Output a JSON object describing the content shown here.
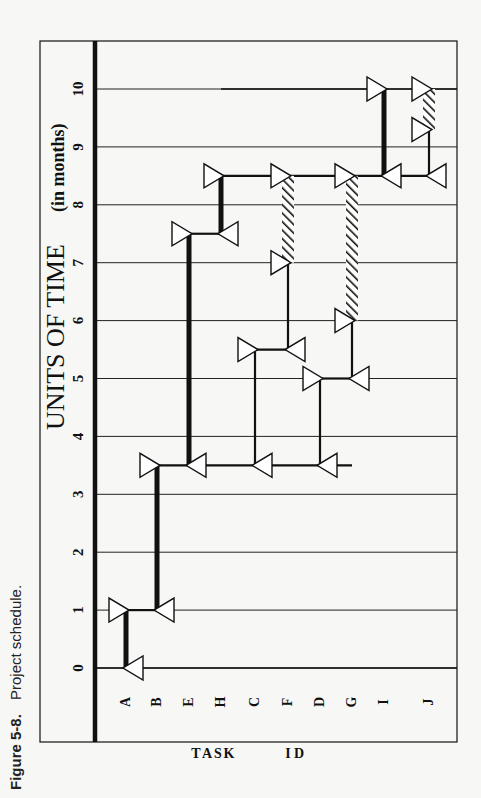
{
  "caption": {
    "figure_label": "Figure 5-8.",
    "text": "Project schedule."
  },
  "axis": {
    "title": "UNITS OF TIME",
    "unit": "(in months)",
    "ticks": [
      "0",
      "1",
      "2",
      "3",
      "4",
      "5",
      "6",
      "7",
      "8",
      "9",
      "10"
    ]
  },
  "task_axis": {
    "label_word1": [
      "T",
      "A",
      "S",
      "K"
    ],
    "label_word2": [
      "I",
      "D"
    ]
  },
  "colors": {
    "ink": "#111111",
    "paper": "#f7f7f5",
    "node_fill": "#ffffff"
  },
  "chart_data": {
    "type": "gantt-network",
    "title": "Project schedule",
    "orientation": "rotated 90° counter-clockwise (time axis runs bottom-to-top)",
    "xlabel": "TASK ID",
    "ylabel": "UNITS OF TIME (in months)",
    "time_range": [
      0,
      10
    ],
    "grid": true,
    "categories": [
      "A",
      "B",
      "E",
      "H",
      "C",
      "F",
      "D",
      "G",
      "I",
      "J"
    ],
    "tasks": [
      {
        "id": "A",
        "start": 0,
        "end": 1,
        "type": "critical"
      },
      {
        "id": "B",
        "start": 1,
        "end": 3.5,
        "type": "critical"
      },
      {
        "id": "E",
        "start": 3.5,
        "end": 7.5,
        "type": "critical"
      },
      {
        "id": "H",
        "start": 7.5,
        "end": 8.5,
        "type": "critical"
      },
      {
        "id": "C",
        "start": 3.5,
        "end": 5.5,
        "type": "normal"
      },
      {
        "id": "F",
        "start": 5.5,
        "end": 7,
        "type": "normal",
        "slack": [
          7,
          8.5
        ]
      },
      {
        "id": "D",
        "start": 3.5,
        "end": 5,
        "type": "normal"
      },
      {
        "id": "G",
        "start": 5,
        "end": 6,
        "type": "normal",
        "slack": [
          6,
          8.5
        ]
      },
      {
        "id": "I",
        "start": 8.5,
        "end": 10,
        "type": "critical"
      },
      {
        "id": "J",
        "start": 8.5,
        "end": 9.3,
        "type": "normal",
        "slack": [
          9.3,
          10
        ]
      }
    ],
    "legend": {
      "thick_bar": "critical-path task",
      "thin_bar": "non-critical task",
      "hatched_bar": "slack time"
    }
  }
}
